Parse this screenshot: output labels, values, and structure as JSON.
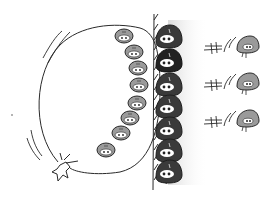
{
  "illustration": {
    "description": "Sketch of cartoon blob creatures lined up against a wall, with a balloon-like loop of small creatures on the left and three creatures flying right with speed lines",
    "colors": {
      "background": "#ffffff",
      "ink": "#2a2a2a",
      "dark_creature": "#3a3a3a",
      "light_creature": "#9a9a9a",
      "eye_white": "#ffffff",
      "shadow": "#e6e6e6"
    },
    "wall_creatures": {
      "count": 7
    },
    "loop_creatures": {
      "count": 8
    },
    "flying_creatures": {
      "count": 3
    }
  }
}
